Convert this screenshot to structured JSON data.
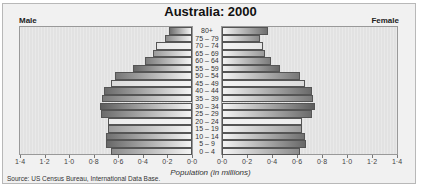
{
  "chart_data": {
    "type": "bar",
    "subtype": "population-pyramid",
    "title": "Australia: 2000",
    "left_label": "Male",
    "right_label": "Female",
    "xlabel": "Population (in millions)",
    "source": "Source: US Census Bureau, International Data Base.",
    "categories": [
      "80+",
      "75 – 79",
      "70 – 74",
      "65 – 69",
      "60 – 64",
      "55 – 59",
      "50 – 54",
      "45 – 49",
      "40 – 44",
      "35 – 39",
      "30 – 34",
      "25 – 29",
      "20 – 24",
      "15 – 19",
      "10 – 14",
      "5 – 9",
      "0 – 4"
    ],
    "series": [
      {
        "name": "Male",
        "values": [
          0.19,
          0.22,
          0.29,
          0.32,
          0.38,
          0.48,
          0.63,
          0.66,
          0.72,
          0.73,
          0.75,
          0.74,
          0.68,
          0.68,
          0.7,
          0.7,
          0.66
        ]
      },
      {
        "name": "Female",
        "values": [
          0.37,
          0.3,
          0.33,
          0.34,
          0.39,
          0.46,
          0.62,
          0.66,
          0.72,
          0.73,
          0.74,
          0.72,
          0.64,
          0.64,
          0.66,
          0.67,
          0.62
        ]
      }
    ],
    "xlim": [
      0,
      1.4
    ],
    "tick_labels_left": [
      "1·4",
      "1·2",
      "1·0",
      "0·8",
      "0·6",
      "0·4",
      "0·2",
      "0·0"
    ],
    "tick_labels_right": [
      "0·0",
      "0·2",
      "0·4",
      "0·6",
      "0·8",
      "1·0",
      "1·2",
      "1·4"
    ],
    "grid": false,
    "legend": "none"
  }
}
